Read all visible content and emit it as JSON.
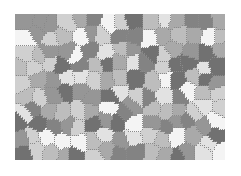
{
  "image": {
    "description": "Grayscale polycrystalline grain microstructure (Voronoi-like polygon cells)",
    "background": "#ffffff",
    "frame": {
      "x": 15,
      "y": 14,
      "width": 210,
      "height": 146
    },
    "grain_border_color": "#8a8a8a",
    "gray_levels": [
      "#f4f4f4",
      "#e2e2e2",
      "#d0d0d0",
      "#bdbdbd",
      "#a9a9a9",
      "#969696",
      "#838383",
      "#717171"
    ]
  }
}
